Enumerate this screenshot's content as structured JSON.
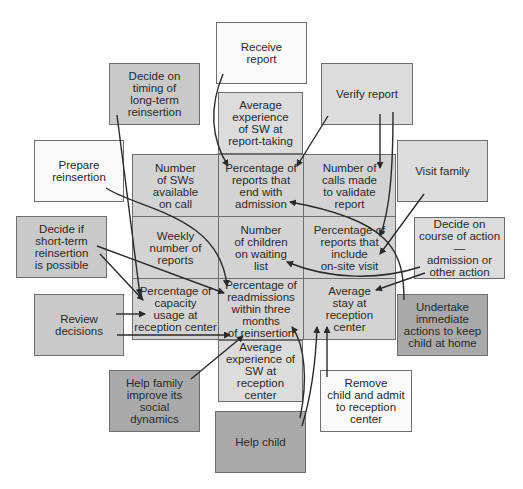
{
  "diagram": {
    "grid_cells": [
      {
        "label": "Number\nof SWs\navailable\non call"
      },
      {
        "label": "Percentage of\nreports that\nend with\nadmission"
      },
      {
        "label": "Number of\ncalls made\nto validate\nreport"
      },
      {
        "label": "Weekly\nnumber of\nreports"
      },
      {
        "label": "Number\nof children\non waiting\nlist"
      },
      {
        "label": "Percentage of\nreports that\ninclude\non-site visit"
      },
      {
        "label": "Percentage of\ncapacity\nusage at\nreception center"
      },
      {
        "label": "Percentage of\nreadmissions\nwithin three months\nof reinsertion"
      },
      {
        "label": "Average\nstay at\nreception\ncenter"
      }
    ],
    "indicator_boxes": {
      "top": {
        "label": "Average\nexperience\nof SW at\nreport-taking"
      },
      "bottom": {
        "label": "Average\nexperience of\nSW at reception\ncenter"
      }
    },
    "activities": {
      "receive_report": {
        "label": "Receive\nreport"
      },
      "decide_timing": {
        "label": "Decide on\ntiming of\nlong-term\nreinsertion"
      },
      "verify_report": {
        "label": "Verify report"
      },
      "prepare_reinsertion": {
        "label": "Prepare\nreinsertion"
      },
      "visit_family": {
        "label": "Visit family"
      },
      "decide_short_term": {
        "label": "Decide if\nshort-term\nreinsertion\nis possible"
      },
      "decide_course": {
        "label": "Decide on\ncourse of action—\nadmission or\nother action"
      },
      "review_decisions": {
        "label": "Review\ndecisions"
      },
      "undertake_actions": {
        "label": "Undertake\nimmediate\nactions to keep\nchild at home"
      },
      "help_family": {
        "label": "Help family\nimprove its\nsocial\ndynamics"
      },
      "remove_child": {
        "label": "Remove\nchild and admit\nto reception\ncenter"
      },
      "help_child": {
        "label": "Help child"
      }
    }
  }
}
